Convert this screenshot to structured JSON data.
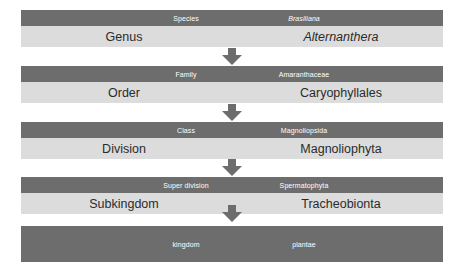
{
  "diagram": {
    "colors": {
      "header_bar": "#6d6d6d",
      "body_bar": "#dcdcdc",
      "header_text": "#ffffff",
      "body_text": "#2b2b2b",
      "arrow": "#6d6d6d",
      "background": "#ffffff"
    },
    "arrow_icon": "down-arrow-icon",
    "arrow_count": 4,
    "levels": [
      {
        "header_rank": "Species",
        "header_name": "Brasiliana",
        "header_name_italic": true,
        "body_rank": "Genus",
        "body_name": "Alternanthera",
        "body_name_italic": true,
        "has_body": true
      },
      {
        "header_rank": "Family",
        "header_name": "Amaranthaceae",
        "header_name_italic": false,
        "body_rank": "Order",
        "body_name": "Caryophyllales",
        "body_name_italic": false,
        "has_body": true
      },
      {
        "header_rank": "Class",
        "header_name": "Magnoliopsida",
        "header_name_italic": false,
        "body_rank": "Division",
        "body_name": "Magnoliophyta",
        "body_name_italic": false,
        "has_body": true
      },
      {
        "header_rank": "Super division",
        "header_name": "Spermatophyta",
        "header_name_italic": false,
        "body_rank": "Subkingdom",
        "body_name": "Tracheobionta",
        "body_name_italic": false,
        "has_body": true
      },
      {
        "header_rank": "kingdom",
        "header_name": "plantae",
        "header_name_italic": false,
        "body_rank": "",
        "body_name": "",
        "body_name_italic": false,
        "has_body": false
      }
    ]
  }
}
